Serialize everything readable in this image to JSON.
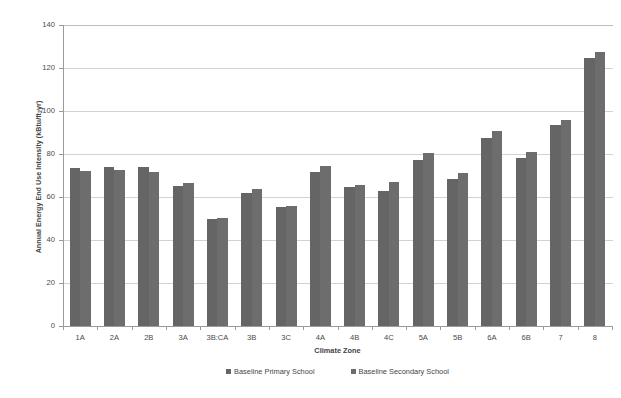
{
  "chart_data": {
    "type": "bar",
    "title": "",
    "xlabel": "Climate Zone",
    "ylabel": "Annual Energy End Use Intensity (kBtu/ft2yr)",
    "ylabel_main": "Annual Energy End Use Intensity (kBtu/ft",
    "ylabel_sub": "2",
    "ylabel_tail": "yr)",
    "ylim": [
      0,
      140
    ],
    "ytick_step": 20,
    "yticks": [
      0,
      20,
      40,
      60,
      80,
      100,
      120,
      140
    ],
    "ytick_labels": [
      "0",
      "20",
      "40",
      "60",
      "80",
      "100",
      "120",
      "140"
    ],
    "grid": true,
    "grid_axis": "y",
    "legend_position": "bottom",
    "categories": [
      "1A",
      "2A",
      "2B",
      "3A",
      "3B:CA",
      "3B",
      "3C",
      "4A",
      "4B",
      "4C",
      "5A",
      "5B",
      "6A",
      "6B",
      "7",
      "8"
    ],
    "series": [
      {
        "name": "Baseline Primary School",
        "color": "#656565",
        "values": [
          73.3,
          73.8,
          73.8,
          65.3,
          49.8,
          62.0,
          55.3,
          71.8,
          64.5,
          62.8,
          77.0,
          68.5,
          87.3,
          78.3,
          93.3,
          124.8
        ]
      },
      {
        "name": "Baseline Secondary School",
        "color": "#6d6d6d",
        "values": [
          72.3,
          72.5,
          71.8,
          66.5,
          50.3,
          63.5,
          55.8,
          74.5,
          65.8,
          66.8,
          80.5,
          71.0,
          90.8,
          80.8,
          96.0,
          127.5
        ]
      }
    ]
  },
  "legend": {
    "items": [
      {
        "label": "Baseline Primary School",
        "color": "#656565"
      },
      {
        "label": "Baseline Secondary School",
        "color": "#6d6d6d"
      }
    ]
  },
  "axes": {
    "x_title": "Climate Zone",
    "y_title_main": "Annual Energy End Use Intensity (kBtu/ft",
    "y_title_sub": "2",
    "y_title_tail": "yr)"
  }
}
